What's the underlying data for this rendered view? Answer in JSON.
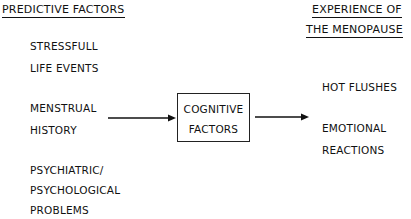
{
  "headers": {
    "left": "PREDICTIVE FACTORS",
    "right_line1": "EXPERIENCE OF",
    "right_line2": "THE MENOPAUSE"
  },
  "predictive_factors": [
    {
      "line1": "STRESSFULL",
      "line2": "LIFE EVENTS"
    },
    {
      "line1": "MENSTRUAL",
      "line2": "HISTORY"
    },
    {
      "line1": "PSYCHIATRIC/",
      "line2": "PSYCHOLOGICAL",
      "line3": "PROBLEMS"
    }
  ],
  "mediator": {
    "line1": "COGNITIVE",
    "line2": "FACTORS"
  },
  "outcomes": [
    {
      "line1": "HOT FLUSHES"
    },
    {
      "line1": "EMOTIONAL",
      "line2": "REACTIONS"
    }
  ],
  "edges": [
    {
      "from": "MENSTRUAL HISTORY",
      "to": "COGNITIVE FACTORS"
    },
    {
      "from": "COGNITIVE FACTORS",
      "to": "EXPERIENCE OF THE MENOPAUSE"
    }
  ],
  "colors": {
    "ink": "#111111",
    "background": "#ffffff"
  }
}
